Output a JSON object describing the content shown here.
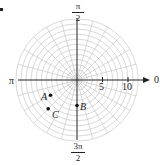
{
  "figure": {
    "type": "polar-grid-plot",
    "marker_visible": true,
    "origin_px": [
      77,
      80
    ],
    "px_per_unit": 5.1,
    "grid": {
      "circle_radii": [
        1,
        2,
        3,
        4,
        5,
        6,
        7,
        8,
        9,
        10,
        11,
        12
      ],
      "spoke_step_deg": 15,
      "grid_color": "#c8c8c8",
      "axis_color": "#222222"
    },
    "axis_labels": {
      "zero": "0",
      "pi": "π",
      "half_pi": {
        "num": "π",
        "den": "2"
      },
      "three_half_pi": {
        "num": "3π",
        "den": "2"
      }
    },
    "radial_ticks": [
      {
        "value": 5,
        "label": "5"
      },
      {
        "value": 10,
        "label": "10"
      }
    ],
    "points": [
      {
        "label": "A",
        "r": 6,
        "theta_deg": 210,
        "theta": "7π/6"
      },
      {
        "label": "B",
        "r": 5,
        "theta_deg": 270,
        "theta": "3π/2"
      },
      {
        "label": "C",
        "r": 8,
        "theta_deg": 225,
        "theta": "5π/4"
      }
    ]
  }
}
